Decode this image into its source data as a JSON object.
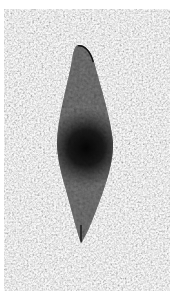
{
  "image": {
    "description": "Grayscale photograph of a dark, elongated leaf- or blade-shaped object on a speckled granite-like background",
    "subject": "dark elongated lanceolate object",
    "background": "speckled light gray textured surface",
    "colors": {
      "border": "#ffffff",
      "background_base": "#d4d4d4",
      "background_light": "#efefef",
      "background_dark": "#9a9a9a",
      "object_edge": "#3a3a3a",
      "object_body": "#2a2a2a",
      "object_center": "#050505"
    }
  }
}
